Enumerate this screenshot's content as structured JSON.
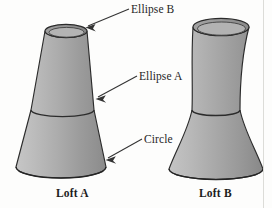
{
  "figure": {
    "background_color": "#fdfdfc",
    "outline_color": "#2b2b2b",
    "fill_light": "#c2c2c2",
    "fill_mid": "#a9a9a9",
    "fill_dark": "#8a8a8a",
    "rim_color": "#9a9a9a",
    "callouts": [
      {
        "id": "ellipse-b",
        "label": "Ellipse B",
        "target": "Loft A top ellipse"
      },
      {
        "id": "ellipse-a",
        "label": "Ellipse A",
        "target": "Loft A middle ellipse"
      },
      {
        "id": "circle",
        "label": "Circle",
        "target": "Loft A base circle"
      }
    ],
    "parts": [
      {
        "id": "loft-a",
        "caption": "Loft A",
        "profile": "straight",
        "top_section": "Ellipse B",
        "mid_section": "Ellipse A",
        "bottom_section": "Circle"
      },
      {
        "id": "loft-b",
        "caption": "Loft B",
        "profile": "curved",
        "top_section": "Ellipse B",
        "mid_section": "Ellipse A",
        "bottom_section": "Circle"
      }
    ]
  }
}
